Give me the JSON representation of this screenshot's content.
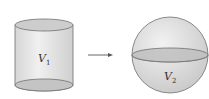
{
  "diagram": {
    "left_shape": {
      "type": "cylinder",
      "label": "V",
      "subscript": "1"
    },
    "arrow": {
      "direction": "right"
    },
    "right_shape": {
      "type": "sphere",
      "label": "V",
      "subscript": "2"
    },
    "colors": {
      "fill_light": "#e6e6e6",
      "fill_mid": "#cfcfcf",
      "stroke": "#6e6e6e",
      "ellipse_fill": "#bdbdbd"
    }
  }
}
